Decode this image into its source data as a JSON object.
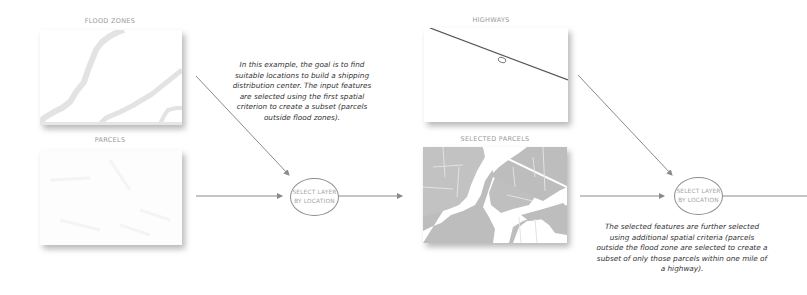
{
  "layers": {
    "flood_zones": {
      "label": "FLOOD ZONES"
    },
    "parcels": {
      "label": "PARCELS"
    },
    "highways": {
      "label": "HIGHWAYS"
    },
    "selected_parcels": {
      "label": "SELECTED PARCELS"
    }
  },
  "nodes": [
    {
      "line1": "SELECT LAYER",
      "line2": "BY LOCATION"
    },
    {
      "line1": "SELECT LAYER",
      "line2": "BY LOCATION"
    }
  ],
  "descriptions": {
    "first": "In this example, the goal is to find suitable locations to build a shipping distribution center. The input features are selected using the first spatial criterion to create a subset (parcels outside flood zones).",
    "second": "The selected features are further selected using additional spatial criteria (parcels outside the flood zone are selected to create a subset of only those parcels within one mile of a highway)."
  },
  "colors": {
    "arrow": "#8a8a8a",
    "node_border": "#8c8c8c",
    "node_text": "#a5a5a5",
    "label_text": "#9a9a9a",
    "flood_fill": "#e4e4e4",
    "parcel_fill": "#b9b9b9",
    "highway_line": "#555555"
  }
}
